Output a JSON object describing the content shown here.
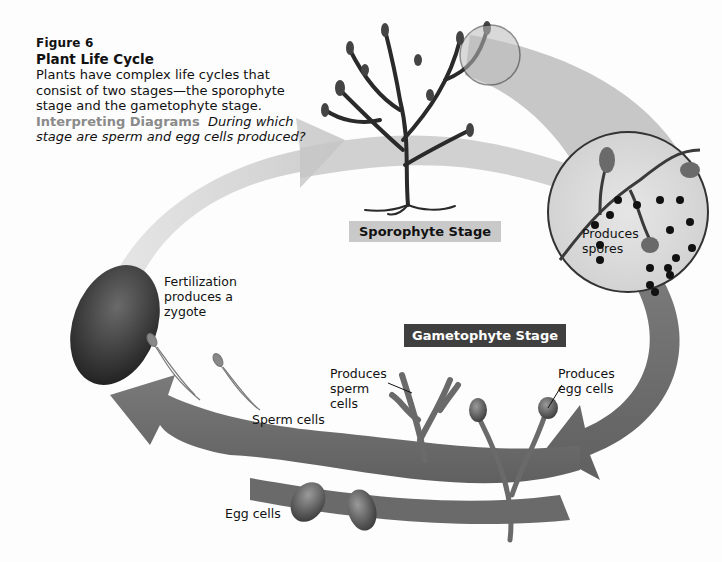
{
  "figure": {
    "number_label": "Figure 6",
    "title": "Plant Life Cycle",
    "description": "Plants have complex life cycles that consist of two stages—the sporophyte stage and the gametophyte stage.",
    "interpreting_label": "Interpreting Diagrams",
    "question": "During which stage are sperm and egg cells produced?"
  },
  "stages": {
    "sporophyte": "Sporophyte Stage",
    "gametophyte": "Gametophyte Stage"
  },
  "labels": {
    "produces_spores": "Produces spores",
    "fertilization": "Fertilization produces a zygote",
    "produces_sperm": "Produces sperm cells",
    "produces_egg": "Produces egg cells",
    "sperm_cells": "Sperm cells",
    "egg_cells": "Egg cells"
  },
  "colors": {
    "arrow_light": "#c8c8c8",
    "arrow_dark": "#6e6e6e",
    "stage_light_bg": "#c9c9c9",
    "stage_dark_bg": "#3f3f3f",
    "interpreting_text": "#8a8a8a"
  }
}
